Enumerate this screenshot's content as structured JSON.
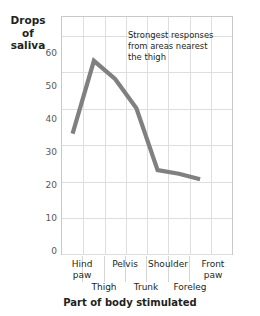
{
  "chart_data": {
    "type": "line",
    "title": "",
    "xlabel": "Part of body stimulated",
    "ylabel": "Drops of saliva",
    "ylabel_lines": [
      "Drops",
      "of",
      "saliva"
    ],
    "categories": [
      "Hind paw",
      "Thigh",
      "Pelvis",
      "Trunk",
      "Shoulder",
      "Foreleg",
      "Front paw"
    ],
    "values": [
      33,
      53,
      48,
      40,
      23,
      22,
      20.5
    ],
    "ylim": [
      0,
      65
    ],
    "yticks": [
      0,
      10,
      20,
      30,
      40,
      50,
      60
    ],
    "ytick_labels": [
      "0",
      "10",
      "20",
      "30",
      "40",
      "50",
      "60"
    ],
    "grid": true,
    "legend": "none",
    "line_color": "#808080",
    "grid_color": "#dedede",
    "border_color": "#c9c9c9",
    "annotations": [
      {
        "text": "Strongest responses from areas nearest the thigh",
        "lines": [
          "Strongest responses",
          "from areas nearest",
          "the thigh"
        ]
      }
    ]
  },
  "axis": {
    "x_row1": [
      "Hind paw",
      "Pelvis",
      "Shoulder",
      "Front paw"
    ],
    "x_row1_lines": [
      [
        "Hind",
        "paw"
      ],
      [
        "Pelvis"
      ],
      [
        "Shoulder"
      ],
      [
        "Front",
        "paw"
      ]
    ],
    "x_row2": [
      "Thigh",
      "Trunk",
      "Foreleg"
    ]
  }
}
